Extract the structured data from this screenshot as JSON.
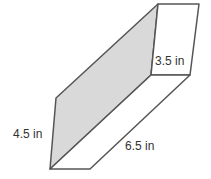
{
  "figure": {
    "type": "right rectangular prism",
    "labels": {
      "height": "4.5 in",
      "width": "3.5 in",
      "length": "6.5 in"
    },
    "colors": {
      "shaded_face": "#d9d9d9",
      "edges": "#555555",
      "background": "#ffffff"
    }
  }
}
